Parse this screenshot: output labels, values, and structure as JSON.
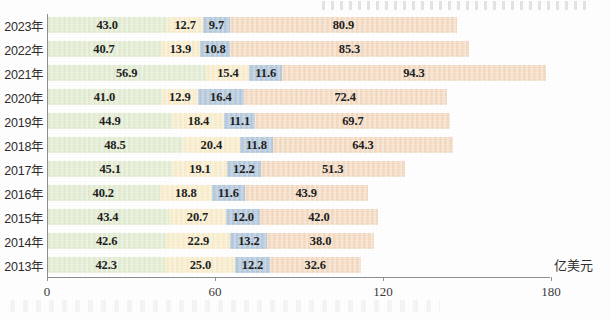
{
  "chart_data": {
    "type": "bar",
    "orientation": "horizontal",
    "stacked": true,
    "title": "",
    "subtitle": "",
    "xlabel": "亿美元",
    "ylabel": "",
    "unit": "亿美元",
    "xlim": [
      0,
      180
    ],
    "xticks": [
      0,
      60,
      120,
      180
    ],
    "xtick_labels": [
      "0",
      "60",
      "120",
      "180"
    ],
    "grid": false,
    "legend": "none",
    "categories": [
      "2023年",
      "2022年",
      "2021年",
      "2020年",
      "2019年",
      "2018年",
      "2017年",
      "2016年",
      "2015年",
      "2014年",
      "2013年"
    ],
    "series": [
      {
        "name": "segment-1",
        "color": "#d9e6c4",
        "values": [
          43.0,
          40.7,
          56.9,
          41.0,
          44.9,
          48.5,
          45.1,
          40.2,
          43.4,
          42.6,
          42.3
        ]
      },
      {
        "name": "segment-2",
        "color": "#f5e6bb",
        "values": [
          12.7,
          13.9,
          15.4,
          12.9,
          18.4,
          20.4,
          19.1,
          18.8,
          20.7,
          22.9,
          25.0
        ]
      },
      {
        "name": "segment-3",
        "color": "#a8bfd6",
        "values": [
          9.7,
          10.8,
          11.6,
          16.4,
          11.1,
          11.8,
          12.2,
          11.6,
          12.0,
          13.2,
          12.2
        ]
      },
      {
        "name": "segment-4",
        "color": "#f0cfb0",
        "values": [
          80.9,
          85.3,
          94.3,
          72.4,
          69.7,
          64.3,
          51.3,
          43.9,
          42.0,
          38.0,
          32.6
        ]
      }
    ],
    "rows": [
      {
        "category": "2023年",
        "values": [
          43.0,
          12.7,
          9.7,
          80.9
        ],
        "labels": [
          "43.0",
          "12.7",
          "9.7",
          "80.9"
        ],
        "total": 146.3
      },
      {
        "category": "2022年",
        "values": [
          40.7,
          13.9,
          10.8,
          85.3
        ],
        "labels": [
          "40.7",
          "13.9",
          "10.8",
          "85.3"
        ],
        "total": 150.7
      },
      {
        "category": "2021年",
        "values": [
          56.9,
          15.4,
          11.6,
          94.3
        ],
        "labels": [
          "56.9",
          "15.4",
          "11.6",
          "94.3"
        ],
        "total": 178.2
      },
      {
        "category": "2020年",
        "values": [
          41.0,
          12.9,
          16.4,
          72.4
        ],
        "labels": [
          "41.0",
          "12.9",
          "16.4",
          "72.4"
        ],
        "total": 142.7
      },
      {
        "category": "2019年",
        "values": [
          44.9,
          18.4,
          11.1,
          69.7
        ],
        "labels": [
          "44.9",
          "18.4",
          "11.1",
          "69.7"
        ],
        "total": 144.1
      },
      {
        "category": "2018年",
        "values": [
          48.5,
          20.4,
          11.8,
          64.3
        ],
        "labels": [
          "48.5",
          "20.4",
          "11.8",
          "64.3"
        ],
        "total": 145.0
      },
      {
        "category": "2017年",
        "values": [
          45.1,
          19.1,
          12.2,
          51.3
        ],
        "labels": [
          "45.1",
          "19.1",
          "12.2",
          "51.3"
        ],
        "total": 127.7
      },
      {
        "category": "2016年",
        "values": [
          40.2,
          18.8,
          11.6,
          43.9
        ],
        "labels": [
          "40.2",
          "18.8",
          "11.6",
          "43.9"
        ],
        "total": 114.5
      },
      {
        "category": "2015年",
        "values": [
          43.4,
          20.7,
          12.0,
          42.0
        ],
        "labels": [
          "43.4",
          "20.7",
          "12.0",
          "42.0"
        ],
        "total": 118.1
      },
      {
        "category": "2014年",
        "values": [
          42.6,
          22.9,
          13.2,
          38.0
        ],
        "labels": [
          "42.6",
          "22.9",
          "13.2",
          "38.0"
        ],
        "total": 116.7
      },
      {
        "category": "2013年",
        "values": [
          42.3,
          25.0,
          12.2,
          32.6
        ],
        "labels": [
          "42.3",
          "25.0",
          "12.2",
          "32.6"
        ],
        "total": 112.1
      }
    ]
  },
  "layout": {
    "plot_left_px": 47,
    "plot_top_px": 14,
    "plot_bottom_px": 277,
    "px_per_unit": 2.8,
    "row_height_px": 24,
    "bar_height_px": 16,
    "first_row_top_px": 14
  },
  "colors": {
    "segment_1": "#d9e6c4",
    "segment_2": "#f5e6bb",
    "segment_3": "#a8bfd6",
    "segment_4": "#f0cfb0",
    "axis": "#8d9093",
    "text": "#2d2d2d",
    "background": "#ffffff"
  }
}
